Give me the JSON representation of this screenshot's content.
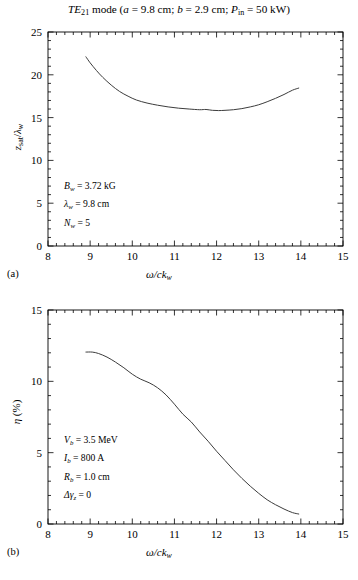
{
  "figure": {
    "title_plain": "TE21 mode (a = 9.8 cm; b = 2.9 cm; Pin = 50 kW)",
    "title_parts": {
      "mode_prefix": "TE",
      "mode_sub": "21",
      "mode_word": "mode",
      "open_paren": "(",
      "a_sym": "a",
      "a_val": "= 9.8 cm;",
      "b_sym": "b",
      "b_val": "= 2.9 cm;",
      "p_sym": "P",
      "p_sub": "in",
      "p_val": "= 50 kW)"
    },
    "background_color": "#ffffff",
    "line_color": "#3c3c3c",
    "axis_color": "#000000"
  },
  "panel_a": {
    "label": "(a)",
    "xlabel_parts": {
      "omega": "ω/c",
      "k": "k",
      "sub": "w"
    },
    "ylabel_parts": {
      "z": "z",
      "zsub": "sat",
      "slash": "/",
      "lam": "λ",
      "lamsub": "w"
    },
    "annotations": [
      {
        "sym": "B",
        "sub": "w",
        "value": "= 3.72 kG"
      },
      {
        "sym": "λ",
        "sub": "w",
        "value": "= 9.8 cm"
      },
      {
        "sym": "N",
        "sub": "w",
        "value": "= 5"
      }
    ]
  },
  "panel_b": {
    "label": "(b)",
    "xlabel_parts": {
      "omega": "ω/c",
      "k": "k",
      "sub": "w"
    },
    "ylabel_parts": {
      "eta": "η",
      "unit": "(%)"
    },
    "annotations": [
      {
        "sym": "V",
        "sub": "b",
        "value": "= 3.5 MeV"
      },
      {
        "sym": "I",
        "sub": "b",
        "value": "= 800 A"
      },
      {
        "sym": "R",
        "sub": "b",
        "value": "= 1.0 cm"
      },
      {
        "sym": "Δγ",
        "sub": "z",
        "value": "= 0"
      }
    ]
  },
  "chart_data": [
    {
      "type": "line",
      "panel": "(a)",
      "title": "TE21 mode (a = 9.8 cm; b = 2.9 cm; Pin = 50 kW)",
      "xlabel": "ω/ck_w",
      "ylabel": "z_sat/λ_w",
      "xlim": [
        8,
        15
      ],
      "ylim": [
        0,
        25
      ],
      "xticks": [
        8,
        9,
        10,
        11,
        12,
        13,
        14,
        15
      ],
      "yticks": [
        0,
        5,
        10,
        15,
        20,
        25
      ],
      "xminor_step": 0.2,
      "yminor_step": 1,
      "grid": false,
      "legend": null,
      "series": [
        {
          "name": "z_sat/lambda_w",
          "x": [
            8.9,
            9.0,
            9.15,
            9.3,
            9.5,
            9.7,
            9.9,
            10.1,
            10.35,
            10.6,
            10.85,
            11.1,
            11.35,
            11.6,
            11.75,
            11.9,
            12.05,
            12.2,
            12.4,
            12.6,
            12.8,
            13.0,
            13.2,
            13.4,
            13.6,
            13.8,
            13.95
          ],
          "y": [
            22.1,
            21.4,
            20.5,
            19.7,
            18.8,
            18.05,
            17.5,
            17.05,
            16.7,
            16.45,
            16.25,
            16.1,
            16.0,
            15.92,
            15.95,
            15.85,
            15.82,
            15.85,
            15.92,
            16.05,
            16.25,
            16.5,
            16.85,
            17.25,
            17.7,
            18.2,
            18.45
          ]
        }
      ],
      "annotations": [
        "B_w = 3.72 kG",
        "λ_w = 9.8 cm",
        "N_w = 5"
      ]
    },
    {
      "type": "line",
      "panel": "(b)",
      "title": "",
      "xlabel": "ω/ck_w",
      "ylabel": "η (%)",
      "xlim": [
        8,
        15
      ],
      "ylim": [
        0,
        15
      ],
      "xticks": [
        8,
        9,
        10,
        11,
        12,
        13,
        14,
        15
      ],
      "yticks": [
        0,
        5,
        10,
        15
      ],
      "xminor_step": 0.2,
      "yminor_step": 1,
      "grid": false,
      "legend": null,
      "series": [
        {
          "name": "efficiency",
          "x": [
            8.9,
            9.05,
            9.2,
            9.4,
            9.6,
            9.8,
            10.0,
            10.2,
            10.4,
            10.6,
            10.8,
            11.0,
            11.2,
            11.4,
            11.6,
            11.8,
            12.0,
            12.2,
            12.4,
            12.6,
            12.8,
            13.0,
            13.2,
            13.4,
            13.6,
            13.8,
            13.95
          ],
          "y": [
            12.05,
            12.05,
            11.95,
            11.7,
            11.35,
            10.95,
            10.5,
            10.15,
            9.9,
            9.55,
            9.05,
            8.4,
            7.7,
            7.15,
            6.45,
            5.8,
            5.1,
            4.45,
            3.8,
            3.2,
            2.65,
            2.15,
            1.7,
            1.35,
            1.05,
            0.8,
            0.7
          ]
        }
      ],
      "annotations": [
        "V_b = 3.5 MeV",
        "I_b = 800 A",
        "R_b = 1.0 cm",
        "Δγ_z = 0"
      ]
    }
  ]
}
